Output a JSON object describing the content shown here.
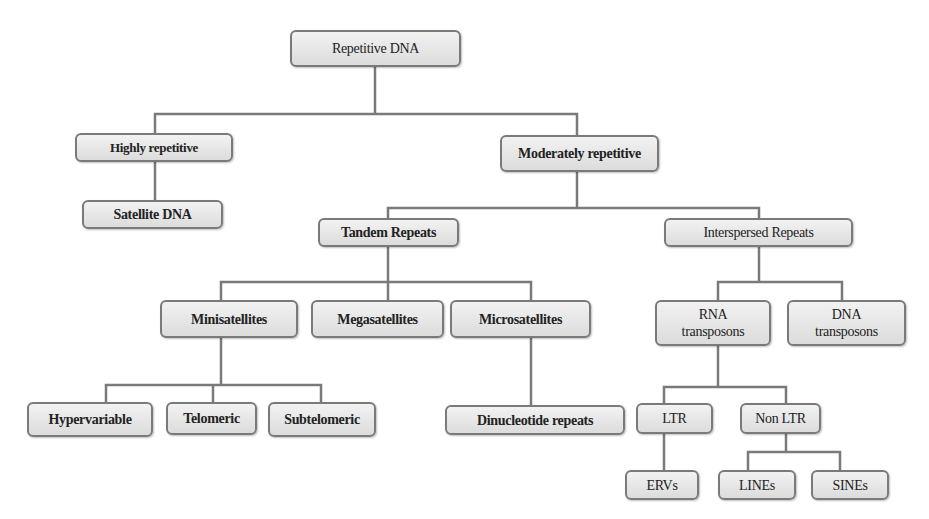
{
  "diagram": {
    "title": "Repetitive DNA",
    "line_color": "#7a7a7a",
    "box_border_color": "#7a7a7a",
    "box_fill_top": "#f2f2f2",
    "box_fill_bottom": "#dcdcdc",
    "nodes": {
      "root": "Repetitive DNA",
      "highly_repetitive": "Highly repetitive",
      "satellite_dna": "Satellite DNA",
      "moderately_repetitive": "Moderately repetitive",
      "tandem_repeats": "Tandem Repeats",
      "interspersed_repeats": "Interspersed Repeats",
      "minisatellites": "Minisatellites",
      "megasatellites": "Megasatellites",
      "microsatellites": "Microsatellites",
      "rna_transposons_line1": "RNA",
      "rna_transposons_line2": "transposons",
      "dna_transposons_line1": "DNA",
      "dna_transposons_line2": "transposons",
      "hypervariable": "Hypervariable",
      "telomeric": "Telomeric",
      "subtelomeric": "Subtelomeric",
      "dinucleotide_repeats": "Dinucleotide repeats",
      "ltr": "LTR",
      "non_ltr": "Non LTR",
      "ervs": "ERVs",
      "lines": "LINEs",
      "sines": "SINEs"
    },
    "edges": [
      [
        "Repetitive DNA",
        "Highly repetitive"
      ],
      [
        "Repetitive DNA",
        "Moderately repetitive"
      ],
      [
        "Highly repetitive",
        "Satellite DNA"
      ],
      [
        "Moderately repetitive",
        "Tandem Repeats"
      ],
      [
        "Moderately repetitive",
        "Interspersed Repeats"
      ],
      [
        "Tandem Repeats",
        "Minisatellites"
      ],
      [
        "Tandem Repeats",
        "Megasatellites"
      ],
      [
        "Tandem Repeats",
        "Microsatellites"
      ],
      [
        "Minisatellites",
        "Hypervariable"
      ],
      [
        "Minisatellites",
        "Telomeric"
      ],
      [
        "Minisatellites",
        "Subtelomeric"
      ],
      [
        "Microsatellites",
        "Dinucleotide repeats"
      ],
      [
        "Interspersed Repeats",
        "RNA transposons"
      ],
      [
        "Interspersed Repeats",
        "DNA transposons"
      ],
      [
        "RNA transposons",
        "LTR"
      ],
      [
        "RNA transposons",
        "Non LTR"
      ],
      [
        "LTR",
        "ERVs"
      ],
      [
        "Non LTR",
        "LINEs"
      ],
      [
        "Non LTR",
        "SINEs"
      ]
    ]
  }
}
